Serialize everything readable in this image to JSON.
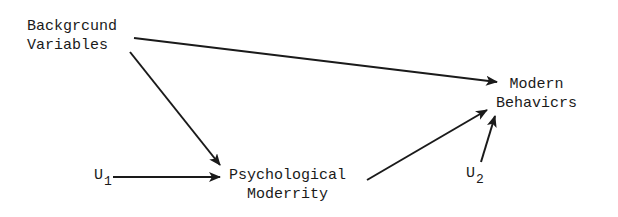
{
  "diagram": {
    "type": "path-diagram",
    "nodes": {
      "background": {
        "line1": "Backgrcund",
        "line2": "Variables"
      },
      "modern_behaviors": {
        "line1": "Modern",
        "line2": "Behavicrs"
      },
      "psych_modernity": {
        "line1": "Psychological",
        "line2": "Moderrity"
      },
      "u1": {
        "base": "U",
        "sub": "1"
      },
      "u2": {
        "base": "U",
        "sub": "2"
      }
    },
    "edges": [
      {
        "from": "Background Variables",
        "to": "Modern Behaviors"
      },
      {
        "from": "Background Variables",
        "to": "Psychological Modernity"
      },
      {
        "from": "U1",
        "to": "Psychological Modernity"
      },
      {
        "from": "Psychological Modernity",
        "to": "Modern Behaviors"
      },
      {
        "from": "U2",
        "to": "Modern Behaviors"
      }
    ],
    "colors": {
      "ink": "#1a1a1a",
      "background": "#ffffff"
    }
  }
}
